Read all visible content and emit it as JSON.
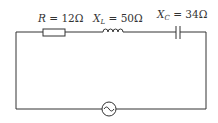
{
  "circuit": {
    "type": "series RLC circuit with AC source",
    "resistor": {
      "symbol": "R",
      "eq": " = ",
      "value": "12Ω"
    },
    "inductor": {
      "symbol": "X",
      "sub": "L",
      "eq": " = ",
      "value": "50Ω"
    },
    "capacitor": {
      "symbol": "X",
      "sub": "C",
      "eq": " = ",
      "value": "34Ω"
    },
    "source": {
      "kind": "ac-source"
    }
  },
  "colors": {
    "wire": "#333333",
    "background": "#ffffff"
  }
}
